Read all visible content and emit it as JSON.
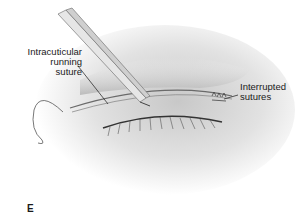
{
  "figure": {
    "panel_letter": "E",
    "labels": {
      "intracuticular_line1": "Intracuticular",
      "intracuticular_line2": "running suture",
      "interrupted_line1": "Interrupted",
      "interrupted_line2": "sutures"
    },
    "colors": {
      "ink": "#1a1a1a",
      "skin_shadow": "#b8b8b8",
      "instrument": "#d9d9d9"
    }
  }
}
